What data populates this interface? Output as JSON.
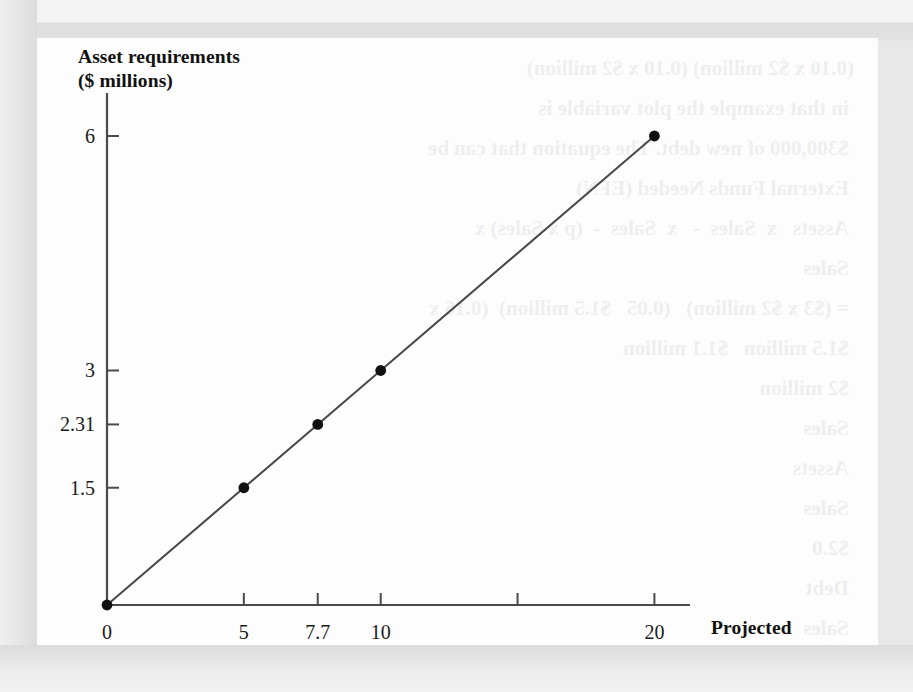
{
  "figure": {
    "background_color": "#fdfdfd",
    "page_color": "#e8e8e8",
    "line_color": "#4a4a4a",
    "marker_color": "#111111",
    "axis_color": "#4a4a4a"
  },
  "bleed_text": "(0.10 x $2 million) (0.10 x $2 million)\n in that example the plot variable is\n $300,000 of new debt. The equation that can be\n External Funds Needed (EFN)\n Assets   x  Sales  -   x  Sales  -  (p x Sales) x\n Sales\n = ($3 x $2 million)   (0.05   $1.5 million)  (0.16 x\n $1.5 million   $1.1 million\n $2 million\n Sales\n Assets\n Sales\n $2.0\n Debt\n Sales\n $1.1\n Projected change in sales",
  "chart_data": {
    "type": "line",
    "title": "",
    "xlabel": "Projected\nsales growth (%)",
    "ylabel": "Asset requirements\n($ millions)",
    "x": [
      0,
      5,
      7.7,
      10,
      20
    ],
    "values": [
      0,
      1.5,
      2.31,
      3,
      6
    ],
    "series": [
      {
        "name": "Asset requirements",
        "x": [
          0,
          5,
          7.7,
          10,
          20
        ],
        "values": [
          0,
          1.5,
          2.31,
          3,
          6
        ]
      }
    ],
    "xlim": [
      0,
      21.3
    ],
    "ylim": [
      0,
      6.55
    ],
    "x_ticks": [
      0,
      5,
      7.7,
      10,
      15,
      20
    ],
    "x_tick_labels": [
      "0",
      "5",
      "7.7",
      "10",
      "",
      "20"
    ],
    "y_ticks": [
      1.5,
      2.31,
      3,
      6
    ],
    "y_tick_labels": [
      "1.5",
      "2.31",
      "3",
      "6"
    ],
    "grid": false,
    "legend": "none",
    "markers": "filled-circle"
  }
}
